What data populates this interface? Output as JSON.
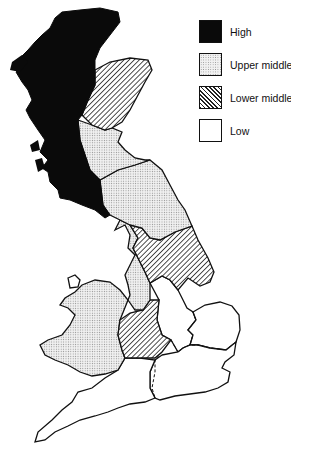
{
  "legend": {
    "items": [
      {
        "label": "High",
        "fill": "solid",
        "color": "#0a0a0a"
      },
      {
        "label": "Upper middle",
        "fill": "dotted",
        "color": "#d9d9d9"
      },
      {
        "label": "Lower middle",
        "fill": "hatched",
        "color": "#333333"
      },
      {
        "label": "Low",
        "fill": "none",
        "color": "#ffffff"
      }
    ]
  },
  "map": {
    "regions": [
      {
        "name": "Scotland (Highlands & West/South)",
        "category": "High"
      },
      {
        "name": "North-East Scotland",
        "category": "Lower middle"
      },
      {
        "name": "East Central Scotland",
        "category": "Upper middle"
      },
      {
        "name": "Northern England",
        "category": "Upper middle"
      },
      {
        "name": "North West England",
        "category": "Upper middle"
      },
      {
        "name": "Yorkshire and Humberside",
        "category": "Lower middle"
      },
      {
        "name": "West Midlands",
        "category": "Lower middle"
      },
      {
        "name": "Wales",
        "category": "Upper middle"
      },
      {
        "name": "East Midlands",
        "category": "Low"
      },
      {
        "name": "East Anglia",
        "category": "Low"
      },
      {
        "name": "South East",
        "category": "Low"
      },
      {
        "name": "South West",
        "category": "Low"
      }
    ]
  }
}
